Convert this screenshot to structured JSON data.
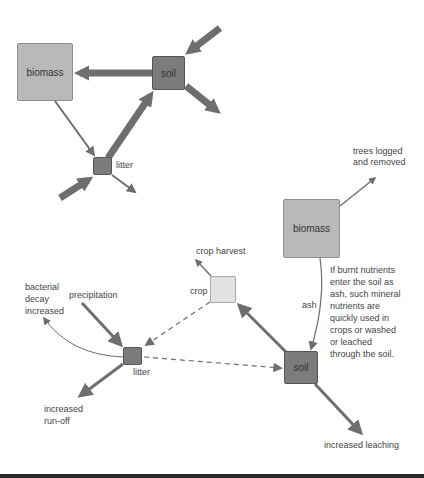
{
  "colors": {
    "arrow": "#6e6e6e",
    "box_light": "#b9b9b9",
    "box_dark": "#7c7c7c",
    "box_pale": "#e2e2e2",
    "bottom_bar": "#2a2a2a"
  },
  "top_cycle": {
    "biomass": {
      "label": "biomass"
    },
    "soil": {
      "label": "soil"
    },
    "litter": {
      "label": "litter"
    }
  },
  "bottom_cycle": {
    "biomass": {
      "label": "biomass"
    },
    "crop": {
      "label": "crop"
    },
    "soil": {
      "label": "soil"
    },
    "litter": {
      "label": "litter"
    },
    "labels": {
      "trees_logged": "trees logged\nand removed",
      "crop_harvest": "crop harvest",
      "ash": "ash",
      "burnt_note": "If burnt nutrients\nenter the soil as\nash, such mineral\nnutrients are\nquickly used in\ncrops or washed\nor leached\nthrough the soil.",
      "bacterial_decay": "bacterial\ndecay\nincreased",
      "precipitation": "precipitation",
      "run_off": "increased\nrun-off",
      "leaching": "increased leaching"
    }
  }
}
